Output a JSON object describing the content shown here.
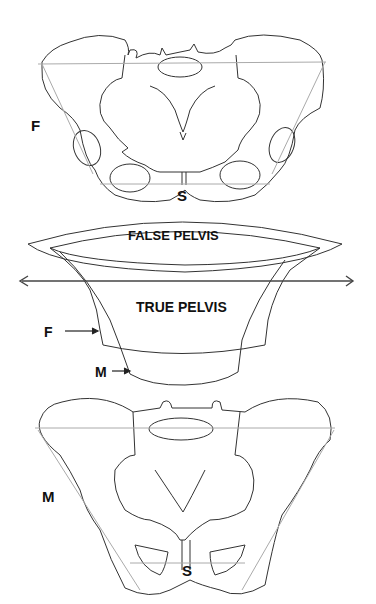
{
  "figure": {
    "top_pelvis": {
      "side_label": "F",
      "symphysis_label": "S"
    },
    "middle": {
      "false_pelvis_label": "FALSE PELVIS",
      "true_pelvis_label": "TRUE PELVIS",
      "female_arrow_label": "F",
      "male_arrow_label": "M"
    },
    "bottom_pelvis": {
      "side_label": "M",
      "symphysis_label": "S"
    },
    "colors": {
      "line": "#333333",
      "guide": "#aaaaaa",
      "background": "#ffffff"
    }
  }
}
